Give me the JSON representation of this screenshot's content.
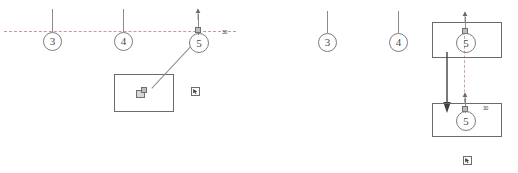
{
  "drawing": {
    "title": "Grid bubble drag operation – before and after",
    "accent_dash_color": "#c49aa0",
    "line_color": "#8a8a8a",
    "rect_color": "#6b6b6b"
  },
  "panels": [
    {
      "id": "before",
      "name": "panel-before",
      "grid_bubbles": [
        {
          "label": "3"
        },
        {
          "label": "4"
        },
        {
          "label": "5"
        }
      ],
      "dimension_label": "30",
      "cursor_icon": "cursor-select-icon",
      "grip_handle": "move-grip-handle",
      "leader_note": "leader-line"
    },
    {
      "id": "after",
      "name": "panel-after",
      "grid_bubbles": [
        {
          "label": "3"
        },
        {
          "label": "4"
        },
        {
          "label": "5"
        },
        {
          "label": "5"
        }
      ],
      "dimension_label": "30",
      "cursor_icon": "cursor-select-icon",
      "move_arrow": "drag-direction-arrow"
    }
  ]
}
